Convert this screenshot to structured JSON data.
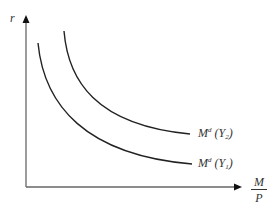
{
  "diagram": {
    "type": "money demand curves",
    "y_axis": {
      "label": "r"
    },
    "x_axis": {
      "label_numerator": "M",
      "label_denominator": "P"
    },
    "curves": [
      {
        "id": "md_y2",
        "label_M": "M",
        "label_sup": "d",
        "label_arg_open": " (Y",
        "label_sub": "2",
        "label_arg_close": ")",
        "position": "outer"
      },
      {
        "id": "md_y1",
        "label_M": "M",
        "label_sup": "d",
        "label_arg_open": " (Y",
        "label_sub": "1",
        "label_arg_close": ")",
        "position": "inner"
      }
    ],
    "colors": {
      "axis": "#555555",
      "curve": "#222222",
      "text": "#333333"
    }
  }
}
